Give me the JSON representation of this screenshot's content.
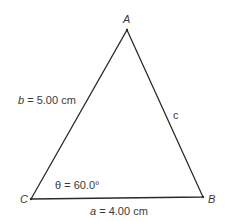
{
  "diagram": {
    "type": "triangle",
    "colors": {
      "stroke": "#2a2a2a",
      "text": "#3a3a3a",
      "background": "#ffffff"
    },
    "vertices": {
      "A": {
        "label": "A",
        "x": 127,
        "y": 30
      },
      "B": {
        "label": "B",
        "x": 203,
        "y": 197
      },
      "C": {
        "label": "C",
        "x": 31,
        "y": 199
      }
    },
    "sides": {
      "a": {
        "var": "a",
        "text": " = 4.00 cm"
      },
      "b": {
        "var": "b",
        "text": " = 5.00 cm"
      },
      "c": {
        "var": "c"
      }
    },
    "angle": {
      "text": "θ = 60.0°"
    }
  }
}
